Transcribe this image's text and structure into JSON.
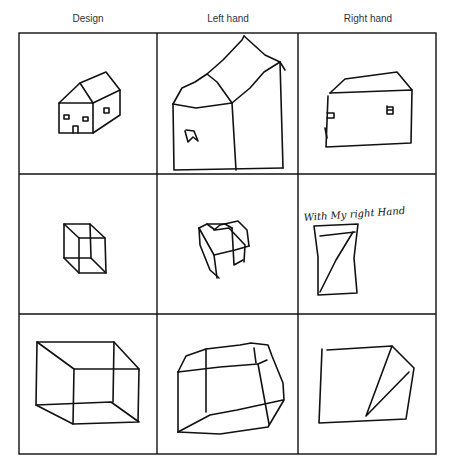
{
  "figure": {
    "columns": [
      "Design",
      "Left hand",
      "Right hand"
    ],
    "rows": [
      {
        "subject": "house"
      },
      {
        "subject": "small cube"
      },
      {
        "subject": "large cube"
      }
    ],
    "annotation": "With My right Hand"
  }
}
